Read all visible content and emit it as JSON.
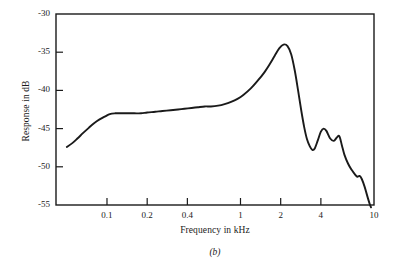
{
  "chart_data": {
    "type": "line",
    "title": "",
    "caption": "(b)",
    "xlabel": "Frequency in kHz",
    "ylabel": "Response in dB",
    "xscale": "log",
    "yscale": "linear",
    "xlim": [
      0.0415,
      10
    ],
    "ylim": [
      -55,
      -30
    ],
    "grid": false,
    "legend": null,
    "xticks": [
      {
        "value": 0.1,
        "label": "0.1"
      },
      {
        "value": 0.2,
        "label": "0.2"
      },
      {
        "value": 0.4,
        "label": "0.4"
      },
      {
        "value": 1,
        "label": "1"
      },
      {
        "value": 2,
        "label": "2"
      },
      {
        "value": 4,
        "label": "4"
      },
      {
        "value": 10,
        "label": "10"
      }
    ],
    "yticks": [
      {
        "value": -30,
        "label": "-30"
      },
      {
        "value": -35,
        "label": "-35"
      },
      {
        "value": -40,
        "label": "-40"
      },
      {
        "value": -45,
        "label": "-45"
      },
      {
        "value": -50,
        "label": "-50"
      },
      {
        "value": -55,
        "label": "-55"
      }
    ],
    "series": [
      {
        "name": "response",
        "color": "#1a1a1a",
        "x": [
          0.05,
          0.055,
          0.06,
          0.066,
          0.073,
          0.08,
          0.088,
          0.097,
          0.105,
          0.115,
          0.125,
          0.14,
          0.16,
          0.18,
          0.2,
          0.23,
          0.26,
          0.3,
          0.34,
          0.38,
          0.43,
          0.48,
          0.54,
          0.6,
          0.68,
          0.76,
          0.85,
          0.95,
          1.05,
          1.2,
          1.35,
          1.5,
          1.65,
          1.8,
          1.95,
          2.1,
          2.25,
          2.4,
          2.55,
          2.7,
          2.85,
          3.0,
          3.15,
          3.3,
          3.45,
          3.6,
          3.8,
          4.0,
          4.2,
          4.4,
          4.7,
          5.0,
          5.25,
          5.5,
          5.75,
          6.0,
          6.4,
          6.8,
          7.2,
          7.5,
          7.8,
          8.1,
          8.5,
          9.0,
          9.3,
          9.5
        ],
        "y": [
          -47.4,
          -46.9,
          -46.3,
          -45.6,
          -44.9,
          -44.3,
          -43.8,
          -43.4,
          -43.1,
          -43.0,
          -43.0,
          -43.0,
          -43.0,
          -43.0,
          -42.9,
          -42.8,
          -42.7,
          -42.6,
          -42.5,
          -42.4,
          -42.3,
          -42.2,
          -42.1,
          -42.1,
          -42.0,
          -41.8,
          -41.5,
          -41.1,
          -40.6,
          -39.7,
          -38.7,
          -37.7,
          -36.6,
          -35.5,
          -34.5,
          -34.0,
          -34.2,
          -35.3,
          -37.4,
          -40.0,
          -42.6,
          -44.8,
          -46.4,
          -47.3,
          -47.8,
          -47.6,
          -46.5,
          -45.4,
          -45.0,
          -45.3,
          -46.3,
          -46.6,
          -46.2,
          -46.0,
          -47.2,
          -48.4,
          -49.6,
          -50.4,
          -51.0,
          -51.3,
          -51.2,
          -51.6,
          -52.6,
          -54.1,
          -54.9,
          -55.3
        ]
      }
    ]
  }
}
